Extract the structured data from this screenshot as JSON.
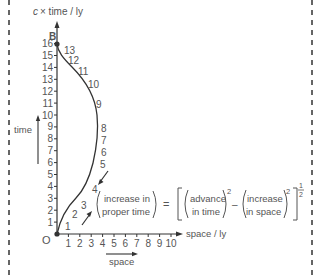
{
  "axes": {
    "y_label_prefix": "c",
    "y_label": "× time / ly",
    "x_label": "space / ly",
    "time_arrow_label": "time",
    "space_arrow_label": "space",
    "origin_label": "O",
    "event_label": "B",
    "y_ticks": [
      "1",
      "2",
      "3",
      "4",
      "5",
      "6",
      "7",
      "8",
      "9",
      "10",
      "11",
      "12",
      "13",
      "14",
      "15",
      "16"
    ],
    "x_ticks": [
      "1",
      "2",
      "3",
      "4",
      "5",
      "6",
      "7",
      "8",
      "9",
      "10"
    ]
  },
  "worldline_marks": [
    "1",
    "2",
    "3",
    "4",
    "5",
    "6",
    "7",
    "8",
    "9",
    "10",
    "11",
    "12",
    "13"
  ],
  "equation": {
    "lhs_top": "increase in",
    "lhs_bottom": "proper time",
    "equals": "=",
    "t1_top": "advance",
    "t1_bottom": "in time",
    "minus": "–",
    "t2_top": "increase",
    "t2_bottom": "in space",
    "sq": "2",
    "half_num": "1",
    "half_den": "2"
  },
  "colors": {
    "ink": "#333333",
    "label": "#555555",
    "dash": "#333333"
  }
}
